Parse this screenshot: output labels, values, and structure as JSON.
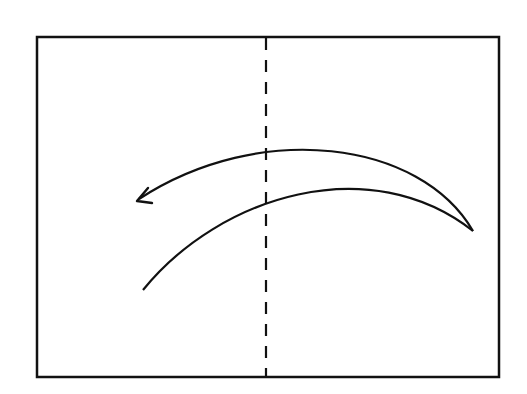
{
  "diagram": {
    "type": "fold-instruction",
    "elements": {
      "paper": "rectangle",
      "fold_line": "valley-fold-dashed",
      "arrow": "curved-fold-arrow pointing left"
    },
    "colors": {
      "stroke": "#111111",
      "background": "#ffffff"
    }
  }
}
